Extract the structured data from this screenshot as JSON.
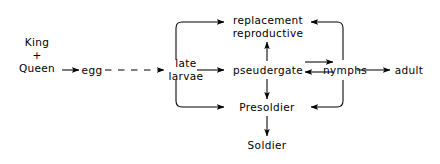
{
  "figure": {
    "background_color": "#ffffff",
    "line_color": "#000000",
    "width": 440,
    "height": 164
  },
  "nodes": {
    "king_queen": {
      "line1": "King",
      "line2": "+",
      "line3": "Queen"
    },
    "egg": {
      "label": "egg"
    },
    "late_larvae": {
      "line1": "late",
      "line2": "larvae"
    },
    "replacement_reproductive": {
      "line1": "replacement",
      "line2": "reproductive"
    },
    "pseudergate": {
      "label": "pseudergate"
    },
    "nymphs": {
      "label": "nymphs"
    },
    "adult": {
      "label": "adult"
    },
    "presoldier": {
      "label": "Presoldier"
    },
    "soldier": {
      "label": "Soldier"
    }
  },
  "edges": [
    {
      "id": "queen-to-egg",
      "from": "King + Queen",
      "to": "egg",
      "style": "solid"
    },
    {
      "id": "egg-to-late-larvae",
      "from": "egg",
      "to": "late larvae",
      "style": "dashed"
    },
    {
      "id": "late-larvae-to-replacement-reproductive",
      "from": "late larvae",
      "to": "replacement reproductive",
      "style": "solid"
    },
    {
      "id": "late-larvae-to-pseudergate",
      "from": "late larvae",
      "to": "pseudergate",
      "style": "solid"
    },
    {
      "id": "late-larvae-to-presoldier",
      "from": "late larvae",
      "to": "Presoldier",
      "style": "solid"
    },
    {
      "id": "pseudergate-to-replacement-reproductive",
      "from": "pseudergate",
      "to": "replacement reproductive",
      "style": "solid"
    },
    {
      "id": "pseudergate-to-presoldier",
      "from": "pseudergate",
      "to": "Presoldier",
      "style": "solid"
    },
    {
      "id": "pseudergate-to-nymphs",
      "from": "pseudergate",
      "to": "nymphs",
      "style": "solid"
    },
    {
      "id": "nymphs-to-pseudergate",
      "from": "nymphs",
      "to": "pseudergate",
      "style": "solid"
    },
    {
      "id": "nymphs-to-replacement-reproductive",
      "from": "nymphs",
      "to": "replacement reproductive",
      "style": "solid"
    },
    {
      "id": "nymphs-to-presoldier",
      "from": "nymphs",
      "to": "Presoldier",
      "style": "solid"
    },
    {
      "id": "nymphs-to-adult",
      "from": "nymphs",
      "to": "adult",
      "style": "solid"
    },
    {
      "id": "presoldier-to-soldier",
      "from": "Presoldier",
      "to": "Soldier",
      "style": "solid"
    }
  ]
}
